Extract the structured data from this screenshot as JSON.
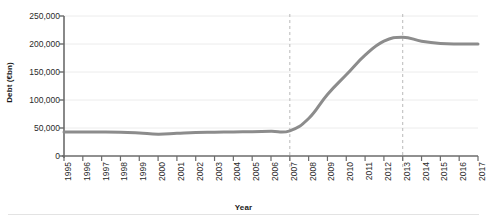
{
  "chart_data": {
    "type": "line",
    "title": "",
    "xlabel": "Year",
    "ylabel": "Debt (€bn)",
    "xlim": [
      1995,
      2017
    ],
    "ylim": [
      0,
      250000
    ],
    "ytick_values": [
      0,
      50000,
      100000,
      150000,
      200000,
      250000
    ],
    "ytick_labels": [
      "0",
      "50,000",
      "100,000",
      "150,000",
      "200,000",
      "250,000"
    ],
    "xtick_labels": [
      "1995",
      "1996",
      "1997",
      "1998",
      "1999",
      "2000",
      "2001",
      "2002",
      "2003",
      "2004",
      "2005",
      "2006",
      "2007",
      "2008",
      "2009",
      "2010",
      "2011",
      "2012",
      "2013",
      "2014",
      "2015",
      "2016",
      "2017"
    ],
    "grid": true,
    "grid_axis": "y",
    "legend": "none",
    "x": [
      1995,
      1996,
      1997,
      1998,
      1999,
      2000,
      2001,
      2002,
      2003,
      2004,
      2005,
      2006,
      2007,
      2008,
      2009,
      2010,
      2011,
      2012,
      2013,
      2014,
      2015,
      2016,
      2017
    ],
    "values": [
      43000,
      43000,
      43000,
      42500,
      41000,
      39000,
      40500,
      42000,
      42500,
      43000,
      43500,
      44000,
      45000,
      67000,
      110000,
      145000,
      180000,
      205000,
      212000,
      205000,
      201000,
      200000,
      200000
    ],
    "series_name": "Debt",
    "series_color": "#8c8c8c",
    "line_width": 3,
    "annotations": [
      {
        "type": "vline",
        "x": 2007,
        "style": "dashed",
        "color": "#b9b9b9"
      },
      {
        "type": "vline",
        "x": 2013,
        "style": "dashed",
        "color": "#b9b9b9"
      }
    ],
    "axis_color": "#6b6b6b",
    "grid_color": "#ececec",
    "background": "#ffffff"
  }
}
